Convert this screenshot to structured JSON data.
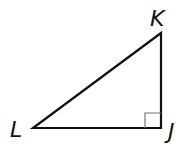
{
  "diagram": {
    "type": "right-triangle",
    "vertices": [
      {
        "label": "K",
        "x": 161,
        "y": 33
      },
      {
        "label": "L",
        "x": 33,
        "y": 128
      },
      {
        "label": "J",
        "x": 161,
        "y": 128
      }
    ],
    "right_angle_at": "J",
    "labels": {
      "K": "K",
      "L": "L",
      "J": "J"
    },
    "colors": {
      "stroke": "#111111",
      "marker": "#777777",
      "background": "#ffffff"
    }
  }
}
